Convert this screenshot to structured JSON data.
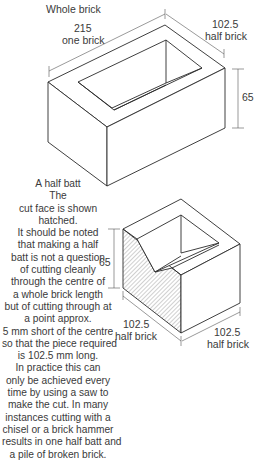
{
  "whole_brick": {
    "title": "Whole brick",
    "length_value": "215",
    "length_label": "one brick",
    "width_value": "102.5",
    "width_label": "half brick",
    "height_value": "65"
  },
  "half_batt": {
    "height_value": "65",
    "depth_value": "102.5",
    "depth_label": "half brick",
    "width_value": "102.5",
    "width_label": "half brick"
  },
  "caption": {
    "lines": [
      "A half batt",
      "The",
      "cut face is shown",
      "hatched.",
      "It should be noted",
      "that making a half",
      "batt is not a question",
      "of cutting cleanly",
      "through the centre of",
      "a whole brick length",
      "but of cutting through at",
      "a point approx.",
      "5 mm short of the centre",
      "so that the piece required",
      "is 102.5 mm long.",
      "In practice this can",
      "only be achieved every",
      "time by using a saw to",
      "make the cut.  In many",
      "instances cutting with a",
      "chisel or a brick hammer",
      "results in one half batt and",
      "a pile of broken brick."
    ]
  },
  "colors": {
    "line": "#2a2a2a",
    "dim_line": "#555555",
    "hatch": "#777777",
    "background": "#ffffff"
  }
}
